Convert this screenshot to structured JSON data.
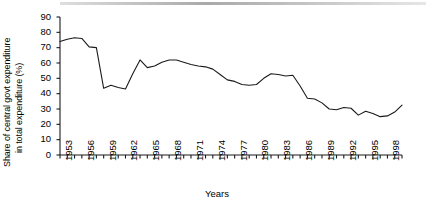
{
  "chart_data": {
    "type": "line",
    "title": "",
    "xlabel": "Years",
    "ylabel": "Share of central govt expenditure in total expenditure (%)",
    "ylabel_line1": "Share of central govt expenditure",
    "ylabel_line2": "in total expenditure (%)",
    "ylim": [
      0,
      90
    ],
    "ytick_labels": [
      "0",
      "10",
      "20",
      "30",
      "40",
      "50",
      "60",
      "70",
      "80",
      "90"
    ],
    "ytick_values": [
      0,
      10,
      20,
      30,
      40,
      50,
      60,
      70,
      80,
      90
    ],
    "xlim": [
      1953,
      2000
    ],
    "xtick_labels": [
      "1953",
      "1956",
      "1959",
      "1962",
      "1965",
      "1968",
      "1971",
      "1974",
      "1977",
      "1980",
      "1983",
      "1986",
      "1989",
      "1992",
      "1995",
      "1998"
    ],
    "xtick_values": [
      1953,
      1956,
      1959,
      1962,
      1965,
      1968,
      1971,
      1974,
      1977,
      1980,
      1983,
      1986,
      1989,
      1992,
      1995,
      1998
    ],
    "minor_xticks_every": 1,
    "grid": false,
    "legend": "none",
    "line_color": "#1a1a1a",
    "axis_color": "#1a1a1a",
    "background": "#ffffff",
    "x": [
      1953,
      1954,
      1955,
      1956,
      1957,
      1958,
      1959,
      1960,
      1961,
      1962,
      1963,
      1964,
      1965,
      1966,
      1967,
      1968,
      1969,
      1970,
      1971,
      1972,
      1973,
      1974,
      1975,
      1976,
      1977,
      1978,
      1979,
      1980,
      1981,
      1982,
      1983,
      1984,
      1985,
      1986,
      1987,
      1988,
      1989,
      1990,
      1991,
      1992,
      1993,
      1994,
      1995,
      1996,
      1997,
      1998,
      1999,
      2000
    ],
    "values": [
      74,
      75.5,
      76.5,
      76,
      70.5,
      70,
      43.5,
      45.5,
      44,
      43,
      53,
      62,
      57,
      58,
      60.5,
      62,
      62,
      60.5,
      59,
      58,
      57.5,
      56,
      52.5,
      49,
      48,
      46,
      45.5,
      46,
      50,
      53,
      52.5,
      51.5,
      52,
      45,
      37,
      36.5,
      34,
      30,
      29.5,
      31,
      30.5,
      26,
      28.5,
      27,
      25,
      25.5,
      28,
      32.5
    ],
    "series_name": "Share of central govt expenditure in total expenditure (%)"
  },
  "figure": {
    "plot_left_px": 60,
    "plot_right_px": 402,
    "plot_top_px": 17,
    "plot_bottom_px": 155
  }
}
